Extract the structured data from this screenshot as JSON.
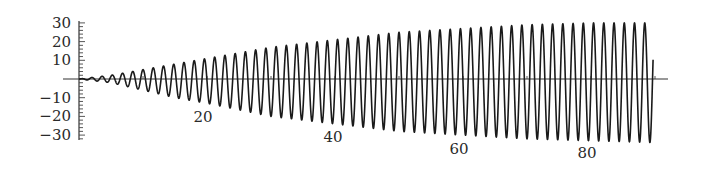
{
  "chart_data": {
    "type": "line",
    "title": "",
    "xlabel": "",
    "ylabel": "",
    "x_ticks": [
      20,
      40,
      60,
      80
    ],
    "x_tick_labels": [
      "20",
      "40",
      "60",
      "80"
    ],
    "y_ticks": [
      30,
      20,
      10,
      -10,
      -20,
      -30
    ],
    "y_tick_labels": [
      "30",
      "20",
      "10",
      "−10",
      "−20",
      "−30"
    ],
    "xlim": [
      -2.5,
      92
    ],
    "ylim": [
      -30,
      30
    ],
    "grid": false,
    "legend": null,
    "series": [
      {
        "name": "signal",
        "color": "#1a1a1a",
        "period": 1.6,
        "x_start": 0,
        "x_end": 89.7,
        "envelope": {
          "x": [
            0,
            5,
            10,
            15,
            20,
            30,
            40,
            50,
            60,
            70,
            80,
            90
          ],
          "upper": [
            0,
            2,
            5,
            8,
            11,
            17,
            21,
            25,
            27,
            29,
            30,
            30
          ],
          "lower": [
            0,
            -2,
            -6,
            -10,
            -13,
            -20,
            -24,
            -28,
            -30,
            -32,
            -33,
            -34
          ]
        }
      }
    ]
  },
  "layout": {
    "origin_px": [
      79,
      79
    ],
    "px_per_x": 6.4,
    "px_per_y": 1.87,
    "x_axis_px": [
      63,
      668
    ],
    "y_axis_px": [
      21,
      140
    ],
    "x_label_px": [
      [
        203,
        117
      ],
      [
        333,
        137
      ],
      [
        459,
        149
      ],
      [
        587,
        153
      ]
    ]
  }
}
